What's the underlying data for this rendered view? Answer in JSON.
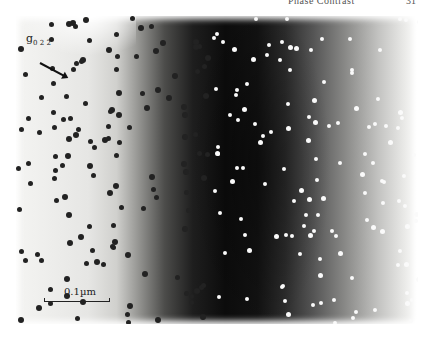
{
  "page": {
    "running_head": "Phase Contrast",
    "page_number": "31"
  },
  "figure": {
    "type": "TEM micrograph",
    "diffraction_vector": {
      "symbol": "g",
      "subscript": "02̅ 2̅",
      "display": "g",
      "display_sub": "0 2 2̅"
    },
    "scale_bar": {
      "label": "0.1µm"
    },
    "regions": [
      "bright-field (dark precipitates)",
      "dark zone (bright precipitates)",
      "bright-field edge"
    ]
  }
}
